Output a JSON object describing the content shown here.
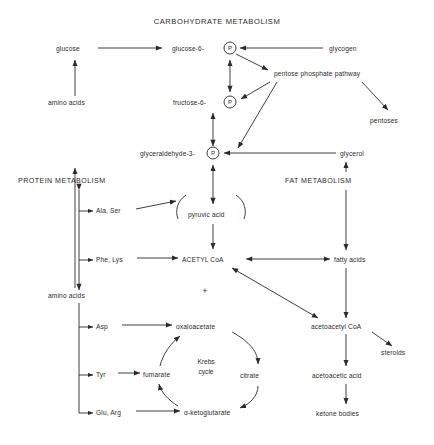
{
  "title": "CARBOHYDRATE METABOLISM",
  "sections": {
    "protein": "PROTEIN METABOLISM",
    "fat": "FAT METABOLISM"
  },
  "labels": {
    "glucose": "glucose",
    "glucose6": "glucose-6-",
    "glycogen": "glycogen",
    "pentose_phosphate_pathway": "pentose phosphate pathway",
    "pentoses": "pentoses",
    "amino_acids_top": "amino acids",
    "fructose6": "fructose-6-",
    "glyceraldehyde3": "glyceraldehyde-3-",
    "glycerol": "glycerol",
    "phosphate_symbol": "P",
    "pyruvic_acid": "pyruvic acid",
    "ala_ser": "Ala, Ser",
    "phe_lys": "Phe, Lys",
    "acetyl_coa": "ACETYL CoA",
    "fatty_acids": "fatty acids",
    "plus": "+",
    "amino_acids_bottom": "amino acids",
    "asp": "Asp",
    "oxaloacetate": "oxaloacetate",
    "acetoacetyl_coa": "acetoacetyl CoA",
    "steroids": "steroids",
    "krebs_line1": "Krebs",
    "krebs_line2": "cycle",
    "tyr": "Tyr",
    "fumarate": "fumarate",
    "citrate": "citrate",
    "acetoacetic_acid": "acetoacetic acid",
    "glu_arg": "Glu, Arg",
    "alpha_ketoglutarate": "α-ketoglutarate",
    "ketone_bodies": "ketone bodies"
  },
  "colors": {
    "ink": "#2b2b2b",
    "background": "#ffffff"
  },
  "diagram_data": {
    "type": "diagram",
    "kind": "metabolic-pathway-flowchart",
    "nodes": [
      {
        "id": "glucose",
        "label": "glucose",
        "x": 75,
        "y": 49
      },
      {
        "id": "glucose6p",
        "label": "glucose-6-P",
        "x": 222,
        "y": 49
      },
      {
        "id": "glycogen",
        "label": "glycogen",
        "x": 348,
        "y": 49
      },
      {
        "id": "pentose_phosphate_pathway",
        "label": "pentose phosphate pathway",
        "x": 282,
        "y": 74
      },
      {
        "id": "pentoses",
        "label": "pentoses",
        "x": 390,
        "y": 121
      },
      {
        "id": "amino_acids_top",
        "label": "amino acids",
        "x": 75,
        "y": 103
      },
      {
        "id": "fructose6p",
        "label": "fructose-6-P",
        "x": 222,
        "y": 102
      },
      {
        "id": "glyceraldehyde3p",
        "label": "glyceraldehyde-3-P",
        "x": 222,
        "y": 153
      },
      {
        "id": "glycerol",
        "label": "glycerol",
        "x": 362,
        "y": 153
      },
      {
        "id": "protein_metabolism",
        "label": "PROTEIN METABOLISM",
        "x": 70,
        "y": 180
      },
      {
        "id": "fat_metabolism",
        "label": "FAT METABOLISM",
        "x": 332,
        "y": 180
      },
      {
        "id": "pyruvic_acid",
        "label": "pyruvic acid",
        "x": 210,
        "y": 215
      },
      {
        "id": "ala_ser",
        "label": "Ala, Ser",
        "x": 108,
        "y": 211
      },
      {
        "id": "phe_lys",
        "label": "Phe, Lys",
        "x": 108,
        "y": 260
      },
      {
        "id": "acetyl_coa",
        "label": "ACETYL CoA",
        "x": 210,
        "y": 260
      },
      {
        "id": "fatty_acids",
        "label": "fatty acids",
        "x": 360,
        "y": 260
      },
      {
        "id": "amino_acids_bottom",
        "label": "amino acids",
        "x": 75,
        "y": 296
      },
      {
        "id": "asp",
        "label": "Asp",
        "x": 108,
        "y": 327
      },
      {
        "id": "oxaloacetate",
        "label": "oxaloacetate",
        "x": 202,
        "y": 327
      },
      {
        "id": "acetoacetyl_coa",
        "label": "acetoacetyl CoA",
        "x": 348,
        "y": 327
      },
      {
        "id": "steroids",
        "label": "steroids",
        "x": 400,
        "y": 352
      },
      {
        "id": "tyr",
        "label": "Tyr",
        "x": 108,
        "y": 375
      },
      {
        "id": "fumarate",
        "label": "fumarate",
        "x": 158,
        "y": 375
      },
      {
        "id": "citrate",
        "label": "citrate",
        "x": 252,
        "y": 375
      },
      {
        "id": "acetoacetic_acid",
        "label": "acetoacetic acid",
        "x": 348,
        "y": 375
      },
      {
        "id": "glu_arg",
        "label": "Glu, Arg",
        "x": 108,
        "y": 413
      },
      {
        "id": "alpha_ketoglutarate",
        "label": "α-ketoglutarate",
        "x": 205,
        "y": 413
      },
      {
        "id": "ketone_bodies",
        "label": "ketone bodies",
        "x": 348,
        "y": 413
      },
      {
        "id": "krebs_cycle",
        "label": "Krebs cycle",
        "x": 205,
        "y": 372
      }
    ],
    "edges": [
      {
        "from": "glucose",
        "to": "glucose6p",
        "kind": "arrow"
      },
      {
        "from": "glycogen",
        "to": "glucose6p",
        "kind": "arrow"
      },
      {
        "from": "glucose6p",
        "to": "pentose_phosphate_pathway",
        "kind": "arrow"
      },
      {
        "from": "pentose_phosphate_pathway",
        "to": "fructose6p",
        "kind": "arrow"
      },
      {
        "from": "pentose_phosphate_pathway",
        "to": "glyceraldehyde3p",
        "kind": "arrow"
      },
      {
        "from": "pentose_phosphate_pathway",
        "to": "pentoses",
        "kind": "arrow"
      },
      {
        "from": "glucose6p",
        "to": "fructose6p",
        "kind": "double-arrow"
      },
      {
        "from": "fructose6p",
        "to": "glyceraldehyde3p",
        "kind": "double-arrow"
      },
      {
        "from": "glyceraldehyde3p",
        "to": "pyruvic_acid",
        "kind": "double-arrow"
      },
      {
        "from": "glycerol",
        "to": "glyceraldehyde3p",
        "kind": "arrow"
      },
      {
        "from": "amino_acids_top",
        "to": "glucose",
        "kind": "arrow"
      },
      {
        "from": "amino_acids_bottom",
        "to": "amino_acids_top",
        "kind": "arrow"
      },
      {
        "from": "ala_ser",
        "to": "pyruvic_acid",
        "kind": "arrow"
      },
      {
        "from": "pyruvic_acid",
        "to": "acetyl_coa",
        "kind": "arrow"
      },
      {
        "from": "phe_lys",
        "to": "acetyl_coa",
        "kind": "arrow"
      },
      {
        "from": "fatty_acids",
        "to": "acetyl_coa",
        "kind": "double-arrow"
      },
      {
        "from": "fat_metabolism",
        "to": "fatty_acids",
        "kind": "arrow"
      },
      {
        "from": "fatty_acids",
        "to": "acetoacetyl_coa",
        "kind": "arrow"
      },
      {
        "from": "acetoacetyl_coa",
        "to": "acetyl_coa",
        "kind": "double-arrow"
      },
      {
        "from": "acetoacetyl_coa",
        "to": "steroids",
        "kind": "arrow"
      },
      {
        "from": "acetoacetyl_coa",
        "to": "acetoacetic_acid",
        "kind": "arrow"
      },
      {
        "from": "acetoacetic_acid",
        "to": "ketone_bodies",
        "kind": "arrow"
      },
      {
        "from": "glycerol",
        "to": "fat_metabolism",
        "kind": "arrow"
      },
      {
        "from": "asp",
        "to": "oxaloacetate",
        "kind": "arrow"
      },
      {
        "from": "tyr",
        "to": "fumarate",
        "kind": "arrow"
      },
      {
        "from": "glu_arg",
        "to": "alpha_ketoglutarate",
        "kind": "arrow"
      },
      {
        "from": "oxaloacetate",
        "to": "citrate",
        "kind": "arc"
      },
      {
        "from": "citrate",
        "to": "alpha_ketoglutarate",
        "kind": "arc"
      },
      {
        "from": "alpha_ketoglutarate",
        "to": "fumarate",
        "kind": "arc"
      },
      {
        "from": "fumarate",
        "to": "oxaloacetate",
        "kind": "arc"
      }
    ]
  }
}
